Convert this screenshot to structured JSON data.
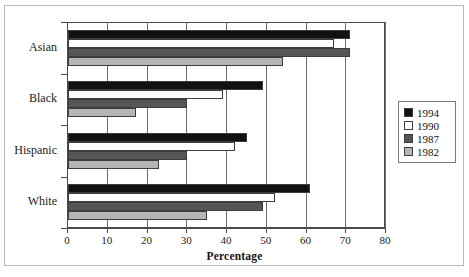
{
  "chart_data": {
    "type": "bar",
    "orientation": "horizontal",
    "title": "",
    "xlabel": "Percentage",
    "ylabel": "",
    "xlim": [
      0,
      80
    ],
    "xticks": [
      0,
      10,
      20,
      30,
      40,
      50,
      60,
      70,
      80
    ],
    "xtick_labels": [
      "0",
      "10",
      "20",
      "30",
      "40",
      "50",
      "60",
      "70",
      "80"
    ],
    "grid": true,
    "grid_axis": "x",
    "legend_position": "right",
    "categories": [
      "Asian",
      "Black",
      "Hispanic",
      "White"
    ],
    "series": [
      {
        "name": "1994",
        "color": "#111111",
        "values": [
          71,
          49,
          45,
          61
        ]
      },
      {
        "name": "1990",
        "color": "#ffffff",
        "values": [
          67,
          39,
          42,
          52
        ]
      },
      {
        "name": "1987",
        "color": "#555555",
        "values": [
          71,
          30,
          30,
          49
        ]
      },
      {
        "name": "1982",
        "color": "#b5b5b5",
        "values": [
          54,
          17,
          23,
          35
        ]
      }
    ]
  },
  "legend": {
    "items": [
      {
        "label": "1994",
        "color": "#111111"
      },
      {
        "label": "1990",
        "color": "#ffffff"
      },
      {
        "label": "1987",
        "color": "#555555"
      },
      {
        "label": "1982",
        "color": "#b5b5b5"
      }
    ]
  }
}
